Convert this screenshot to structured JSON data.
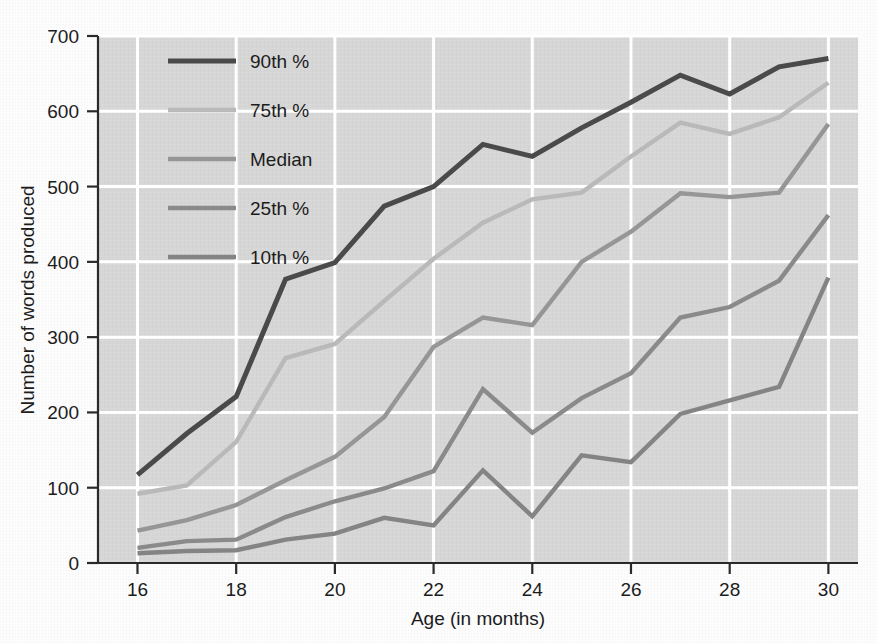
{
  "chart_data": {
    "type": "line",
    "title": "",
    "xlabel": "Age (in months)",
    "ylabel": "Number of words produced",
    "x": [
      16,
      17,
      18,
      19,
      20,
      21,
      22,
      23,
      24,
      25,
      26,
      27,
      28,
      29,
      30
    ],
    "xticks": [
      16,
      18,
      20,
      22,
      24,
      26,
      28,
      30
    ],
    "xtick_labels": [
      "16",
      "18",
      "20",
      "22",
      "24",
      "26",
      "28",
      "30"
    ],
    "yticks": [
      0,
      100,
      200,
      300,
      400,
      500,
      600,
      700
    ],
    "ytick_labels": [
      "0",
      "100",
      "200",
      "300",
      "400",
      "500",
      "600",
      "700"
    ],
    "xlim": [
      15.2,
      30.6
    ],
    "ylim": [
      0,
      700
    ],
    "grid": true,
    "legend_position": "upper-left-inside",
    "plot_background": "#d6d6d6",
    "gridline_color": "#ffffff",
    "series": [
      {
        "name": "90th %",
        "color": "#4a4a4a",
        "width": 5.0,
        "values": [
          117,
          172,
          221,
          377,
          399,
          474,
          500,
          556,
          540,
          578,
          612,
          648,
          623,
          659,
          670
        ]
      },
      {
        "name": "75th %",
        "color": "#b9b9b9",
        "width": 4.4,
        "values": [
          92,
          103,
          161,
          272,
          291,
          348,
          404,
          452,
          483,
          492,
          540,
          585,
          570,
          592,
          638
        ]
      },
      {
        "name": "Median",
        "color": "#969696",
        "width": 4.4,
        "values": [
          43,
          57,
          77,
          110,
          141,
          194,
          287,
          326,
          316,
          400,
          440,
          491,
          486,
          492,
          583
        ]
      },
      {
        "name": "25th %",
        "color": "#8a8a8a",
        "width": 4.4,
        "values": [
          20,
          29,
          31,
          61,
          82,
          99,
          122,
          231,
          173,
          219,
          252,
          326,
          340,
          375,
          462
        ]
      },
      {
        "name": "10th %",
        "color": "#848484",
        "width": 4.4,
        "values": [
          13,
          16,
          17,
          31,
          39,
          60,
          50,
          123,
          62,
          143,
          134,
          198,
          216,
          234,
          379
        ]
      }
    ],
    "legend": [
      {
        "label": "90th %",
        "color": "#4a4a4a",
        "width": 5.0
      },
      {
        "label": "75th %",
        "color": "#b9b9b9",
        "width": 4.4
      },
      {
        "label": "Median",
        "color": "#969696",
        "width": 4.4
      },
      {
        "label": "25th %",
        "color": "#8a8a8a",
        "width": 4.4
      },
      {
        "label": "10th %",
        "color": "#848484",
        "width": 4.4
      }
    ]
  }
}
